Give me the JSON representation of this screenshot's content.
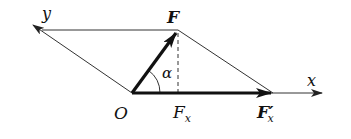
{
  "diagram": {
    "type": "force-decomposition-parallelogram",
    "colors": {
      "line": "#222222",
      "background": "#ffffff"
    },
    "labels": {
      "y_axis": "y",
      "x_axis": "x",
      "origin": "O",
      "force": "F",
      "angle": "α",
      "component": "F",
      "component_sub": "x",
      "component_prime": "F′",
      "component_prime_sub": "x"
    },
    "points": {
      "O": [
        132,
        93
      ],
      "F_tip": [
        178,
        30
      ],
      "y_tip": [
        32,
        24
      ],
      "top_left": [
        42,
        30
      ],
      "Fx_prime": [
        273,
        93
      ],
      "x_tip": [
        322,
        93
      ]
    }
  }
}
